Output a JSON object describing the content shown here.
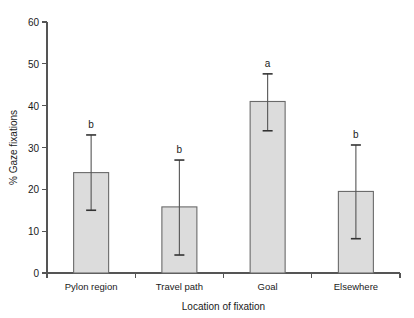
{
  "chart_data": {
    "type": "bar",
    "title": "",
    "subtitle": "",
    "xlabel": "Location of fixation",
    "ylabel": "% Gaze fixations",
    "categories": [
      "Pylon region",
      "Travel path",
      "Goal",
      "Elsewhere"
    ],
    "values": [
      24.0,
      15.8,
      41.0,
      19.5
    ],
    "error_upper": [
      33.0,
      27.0,
      47.6,
      30.6
    ],
    "error_lower": [
      15.0,
      4.3,
      34.0,
      8.2
    ],
    "annotations": [
      "b",
      "b",
      "a",
      "b"
    ],
    "ylim": [
      0,
      60
    ],
    "yticks": [
      0,
      10,
      20,
      30,
      40,
      50,
      60
    ],
    "ytick_labels": [
      "0",
      "10",
      "20",
      "30",
      "40",
      "50",
      "60"
    ],
    "grid": false,
    "legend": false,
    "legend_position": "none",
    "bar_fill_color": "#dcdcdc",
    "bar_edge_color": "#6a6a6a",
    "error_bar_color": "#555555",
    "axis_color": "#555555",
    "background_color": "#ffffff"
  }
}
